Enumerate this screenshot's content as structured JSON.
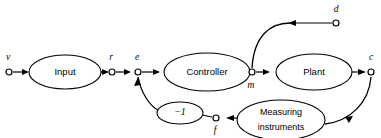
{
  "diagram": {
    "type": "control-system-block-diagram",
    "background_color": "#ffffff",
    "line_color": "#000000",
    "blocks": [
      {
        "id": "input",
        "label": "Input",
        "cx": 65,
        "cy": 72,
        "rx": 36,
        "ry": 17
      },
      {
        "id": "controller",
        "label": "Controller",
        "cx": 207,
        "cy": 72,
        "rx": 43,
        "ry": 19
      },
      {
        "id": "plant",
        "label": "Plant",
        "cx": 314,
        "cy": 72,
        "rx": 38,
        "ry": 18
      },
      {
        "id": "gain",
        "label": "−1",
        "cx": 180,
        "cy": 113,
        "rx": 23,
        "ry": 11
      },
      {
        "id": "measuring",
        "label_line1": "Measuring",
        "label_line2": "instruments",
        "cx": 281,
        "cy": 120,
        "rx": 44,
        "ry": 20
      }
    ],
    "signals": [
      {
        "id": "v",
        "label": "v",
        "x": 9,
        "y": 72,
        "label_x": 8,
        "label_y": 58
      },
      {
        "id": "r",
        "label": "r",
        "x": 112,
        "y": 72,
        "label_x": 111,
        "label_y": 58
      },
      {
        "id": "e",
        "label": "e",
        "x": 138,
        "y": 72,
        "label_x": 137,
        "label_y": 58
      },
      {
        "id": "m",
        "label": "m",
        "x": 252,
        "y": 72,
        "label_x": 251,
        "label_y": 85
      },
      {
        "id": "c",
        "label": "c",
        "x": 371,
        "y": 72,
        "label_x": 371,
        "label_y": 58
      },
      {
        "id": "d",
        "label": "d",
        "x": 336,
        "y": 23,
        "label_x": 336,
        "label_y": 10
      },
      {
        "id": "f",
        "label": "f",
        "x": 216,
        "y": 118,
        "label_x": 215,
        "label_y": 131
      }
    ],
    "connections": [
      {
        "from": "v",
        "to": "input",
        "kind": "forward"
      },
      {
        "from": "input",
        "to": "r",
        "kind": "forward"
      },
      {
        "from": "r",
        "to": "e",
        "kind": "forward"
      },
      {
        "from": "e",
        "to": "controller",
        "kind": "forward"
      },
      {
        "from": "controller",
        "to": "m",
        "kind": "forward"
      },
      {
        "from": "m",
        "to": "plant",
        "kind": "forward"
      },
      {
        "from": "plant",
        "to": "c",
        "kind": "forward"
      },
      {
        "from": "d",
        "to": "m",
        "kind": "disturbance"
      },
      {
        "from": "c",
        "to": "measuring",
        "kind": "feedback"
      },
      {
        "from": "measuring",
        "to": "f",
        "kind": "feedback"
      },
      {
        "from": "f",
        "to": "gain",
        "kind": "feedback"
      },
      {
        "from": "gain",
        "to": "e",
        "kind": "feedback"
      }
    ]
  }
}
